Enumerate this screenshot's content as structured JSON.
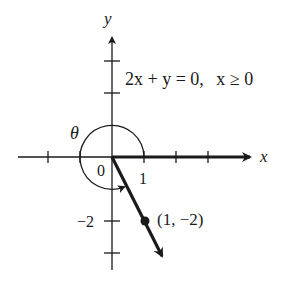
{
  "axes": {
    "x_label": "x",
    "y_label": "y",
    "origin_label": "0",
    "x_tick_label": "1",
    "y_tick_label": "−2"
  },
  "equation": {
    "part1": "2x + y = 0,",
    "part2": "x ≥ 0"
  },
  "angle_label": "θ",
  "point": {
    "label": "(1, −2)",
    "x": 1,
    "y": -2
  },
  "colors": {
    "ink": "#1a1a1a",
    "background": "#ffffff"
  }
}
